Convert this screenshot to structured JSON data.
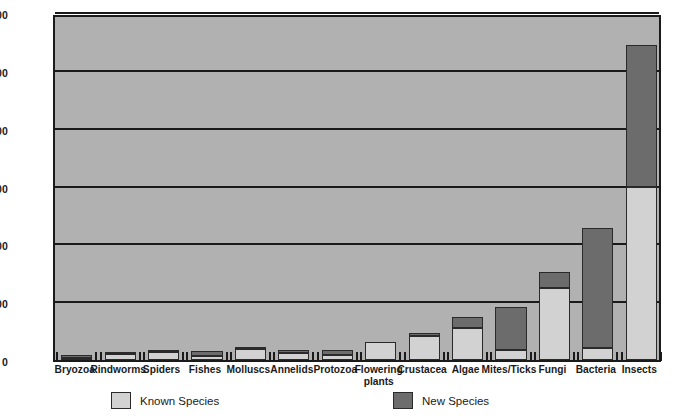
{
  "chart_data": {
    "type": "bar",
    "title": "",
    "subtitle": "",
    "xlabel": "",
    "ylabel": "",
    "stacked": true,
    "grid": true,
    "legend_position": "bottom",
    "ylim": [
      0,
      60000
    ],
    "yticks": [
      0,
      10000,
      20000,
      30000,
      40000,
      50000,
      60000
    ],
    "ytick_labels": [
      "0",
      "10,000",
      "20,000",
      "30,000",
      "40,000",
      "50,000",
      "60,000"
    ],
    "categories": [
      "Bryozoa",
      "Rindworms",
      "Spiders",
      "Fishes",
      "Molluscs",
      "Annelids",
      "Protozoa",
      "Flowering\nplants",
      "Crustacea",
      "Algae",
      "Mites/Ticks",
      "Fungi",
      "Bacteria",
      "Insects"
    ],
    "series": [
      {
        "name": "Known Species",
        "color": "#d2d2d2",
        "values": [
          300,
          1000,
          1400,
          700,
          1900,
          1200,
          800,
          3200,
          4100,
          5600,
          1800,
          12500,
          2000,
          30000
        ]
      },
      {
        "name": "New Species",
        "color": "#6c6c6c",
        "values": [
          500,
          100,
          100,
          900,
          100,
          500,
          900,
          0,
          600,
          1800,
          7400,
          2800,
          20800,
          24500
        ]
      }
    ],
    "totals": [
      800,
      1100,
      1500,
      1600,
      2000,
      1700,
      1700,
      3200,
      4700,
      7400,
      9200,
      15300,
      22800,
      54500
    ]
  },
  "legend": {
    "items": [
      {
        "label": "Known Species",
        "swatch": "known"
      },
      {
        "label": "New Species",
        "swatch": "newsp"
      }
    ]
  },
  "colors": {
    "plot_background": "#b1b1b1",
    "axis": "#1a1a1a",
    "known_species": "#d2d2d2",
    "new_species": "#6c6c6c",
    "page_background": "#ffffff"
  }
}
